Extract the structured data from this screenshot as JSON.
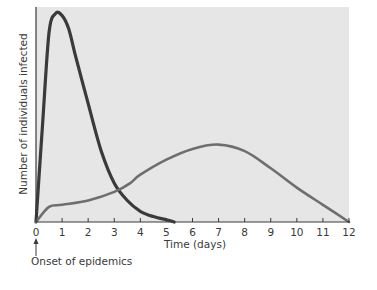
{
  "chart_data": {
    "type": "line",
    "title": "",
    "xlabel": "Time (days)",
    "ylabel": "Number of individuals infected",
    "xlim": [
      0,
      12
    ],
    "ylim": [
      0,
      1
    ],
    "y_ticks_shown": false,
    "grid": false,
    "legend": "none",
    "x_ticks": [
      "0",
      "1",
      "2",
      "3",
      "4",
      "5",
      "6",
      "7",
      "8",
      "9",
      "10",
      "11",
      "12"
    ],
    "annotation": {
      "text": "Onset of epidemics",
      "at_x": 0
    },
    "series": [
      {
        "name": "epidemic-1 (fast, sharp peak)",
        "color": "#3a3a3a",
        "x": [
          0,
          0.25,
          0.5,
          0.75,
          1.0,
          1.25,
          1.5,
          2.0,
          2.5,
          3.0,
          3.5,
          4.0,
          4.5,
          5.0,
          5.3
        ],
        "y": [
          0.0,
          0.45,
          0.88,
          0.97,
          0.96,
          0.9,
          0.78,
          0.55,
          0.33,
          0.18,
          0.1,
          0.05,
          0.025,
          0.01,
          0.0
        ]
      },
      {
        "name": "epidemic-2 (slow, broad peak)",
        "color": "#6e6e6e",
        "x": [
          0,
          0.5,
          1,
          2,
          3,
          3.6,
          4,
          5,
          6,
          7,
          8,
          9,
          10,
          11,
          12
        ],
        "y": [
          0.0,
          0.07,
          0.08,
          0.1,
          0.14,
          0.18,
          0.22,
          0.29,
          0.34,
          0.36,
          0.33,
          0.25,
          0.16,
          0.08,
          0.0
        ]
      }
    ]
  },
  "labels": {
    "ylabel": "Number of individuals infected",
    "xlabel": "Time (days)",
    "onset": "Onset of epidemics"
  }
}
